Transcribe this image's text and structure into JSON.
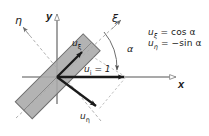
{
  "figure": {
    "background": "#ffffff",
    "width": 209,
    "height": 136
  },
  "colors": {
    "axis": "#8c8c8c",
    "dashed_axis": "#9a9a9a",
    "vector": "#1a1a1a",
    "rect_fill": "#a8a8a8",
    "rect_stroke": "#6e6e6e",
    "text": "#1a1a1a",
    "arc": "#6e6e6e"
  },
  "axes": {
    "x_label": "x",
    "y_label": "y",
    "xi_label": "ξ",
    "eta_label": "η"
  },
  "vectors": {
    "u_xi_label": "u",
    "u_xi_sub": "ξ",
    "u_eta_label": "u",
    "u_eta_sub": "η",
    "u_i_label": "u",
    "u_i_sub": "i",
    "u_i_value": "= 1",
    "u_i_full": "uᵢ = 1"
  },
  "angle": {
    "label": "α",
    "description": "rotation angle between x-axis and ξ-axis"
  },
  "equations": [
    {
      "lhs_base": "u",
      "lhs_sub": "ξ",
      "rhs": "= cos α",
      "full": "uξ = cos α"
    },
    {
      "lhs_base": "u",
      "lhs_sub": "η",
      "rhs": "= −sin α",
      "full": "uη = −sin α"
    }
  ],
  "geometry": {
    "origin_x": 57,
    "origin_y": 77,
    "x_axis_end": 178,
    "y_axis_top": 11,
    "rect_angle_deg": -45,
    "u_i_tip_x": 126
  }
}
